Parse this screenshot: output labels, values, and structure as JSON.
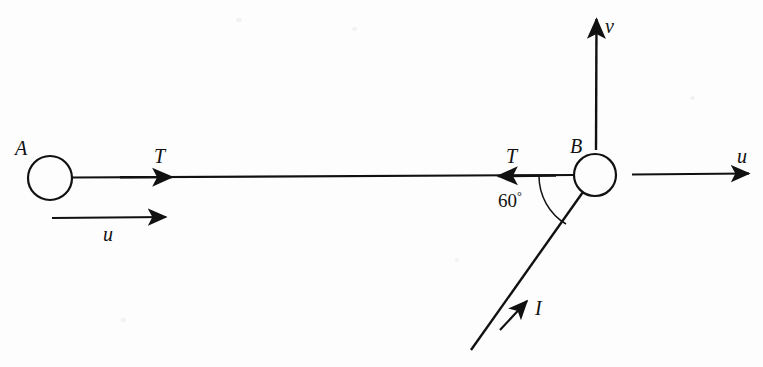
{
  "figure": {
    "background_color": "#fdfdfd",
    "ink_color": "#111111",
    "width": 763,
    "height": 367
  },
  "bodies": [
    {
      "id": "ball-a",
      "label": "A",
      "cx": 50,
      "cy": 178,
      "r": 22
    },
    {
      "id": "ball-b",
      "label": "B",
      "cx": 595,
      "cy": 175,
      "r": 21
    }
  ],
  "connector": {
    "name": "string",
    "from": [
      72,
      177
    ],
    "to": [
      574,
      175
    ]
  },
  "vectors": [
    {
      "id": "tension-a",
      "label": "T",
      "direction": "right",
      "description": "tension on ball A toward B"
    },
    {
      "id": "tension-b",
      "label": "T",
      "direction": "left",
      "description": "tension on ball B toward A"
    },
    {
      "id": "velocity-u-left",
      "label": "u",
      "direction": "right",
      "description": "initial speed of ball A"
    },
    {
      "id": "velocity-u-right",
      "label": "u",
      "direction": "right",
      "description": "initial speed of ball B"
    },
    {
      "id": "velocity-v",
      "label": "v",
      "direction": "up",
      "description": "vertical velocity component at ball B"
    },
    {
      "id": "impulse-i",
      "label": "I",
      "direction": "up-right",
      "description": "impulse applied to ball B"
    }
  ],
  "angle": {
    "id": "angle-at-b",
    "value": "60",
    "unit": "°",
    "text": "60",
    "between": [
      "string",
      "impulse-i"
    ]
  }
}
